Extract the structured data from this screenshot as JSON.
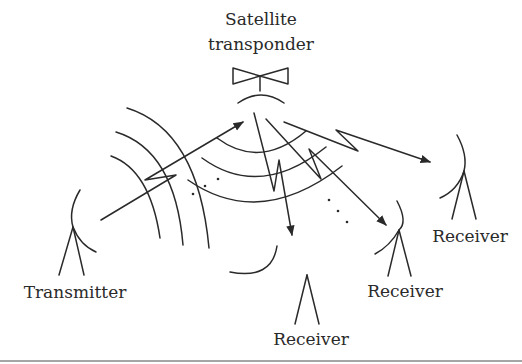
{
  "diagram": {
    "satellite": {
      "label_line1": "Satellite",
      "label_line2": "transponder",
      "icon": "satellite-transponder-icon"
    },
    "transmitter": {
      "label": "Transmitter",
      "icon": "dish-antenna-icon"
    },
    "receivers": [
      {
        "label": "Receiver",
        "position": "bottom-center"
      },
      {
        "label": "Receiver",
        "position": "middle-right"
      },
      {
        "label": "Receiver",
        "position": "far-right"
      }
    ],
    "colors": {
      "stroke": "#2a2a2a",
      "background": "#ffffff",
      "rule": "#888888"
    }
  }
}
